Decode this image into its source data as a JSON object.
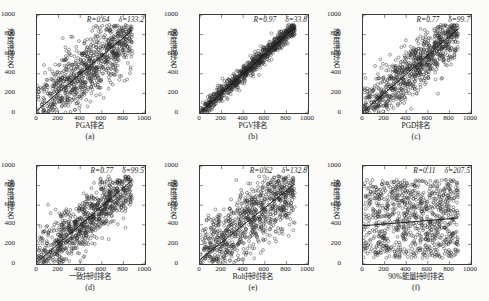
{
  "figure": {
    "ylabel": "速度谱排名",
    "axis_ticks": [
      "0",
      "200",
      "400",
      "600",
      "800",
      "1000"
    ],
    "axis_min": 0,
    "axis_max": 1000
  },
  "chart_data": [
    {
      "type": "scatter",
      "panel": "(a)",
      "xlabel": "PGA排名",
      "ylabel": "速度谱排名",
      "R_label": "R=0.64",
      "delta_label": "δ=133.2",
      "R": 0.64,
      "delta": 133.2,
      "xlim": [
        0,
        1000
      ],
      "ylim": [
        0,
        1000
      ],
      "xticks": [
        0,
        200,
        400,
        600,
        800,
        1000
      ],
      "yticks": [
        0,
        200,
        400,
        600,
        800,
        1000
      ],
      "grid": false,
      "n_points": 860,
      "spread": 175,
      "trend": {
        "slope": 0.93,
        "intercept": 25
      },
      "seed": 11
    },
    {
      "type": "scatter",
      "panel": "(b)",
      "xlabel": "PGV排名",
      "ylabel": "速度谱排名",
      "R_label": "R=0.97",
      "delta_label": "δ=33.8",
      "R": 0.97,
      "delta": 33.8,
      "xlim": [
        0,
        1000
      ],
      "ylim": [
        0,
        1000
      ],
      "xticks": [
        0,
        200,
        400,
        600,
        800,
        1000
      ],
      "yticks": [
        0,
        200,
        400,
        600,
        800,
        1000
      ],
      "grid": false,
      "n_points": 860,
      "spread": 45,
      "trend": {
        "slope": 0.99,
        "intercept": 5
      },
      "seed": 23
    },
    {
      "type": "scatter",
      "panel": "(c)",
      "xlabel": "PGD排名",
      "ylabel": "速度谱排名",
      "R_label": "R=0.77",
      "delta_label": "δ=99.7",
      "R": 0.77,
      "delta": 99.7,
      "xlim": [
        0,
        1000
      ],
      "ylim": [
        0,
        1000
      ],
      "xticks": [
        0,
        200,
        400,
        600,
        800,
        1000
      ],
      "yticks": [
        0,
        200,
        400,
        600,
        800,
        1000
      ],
      "grid": false,
      "n_points": 860,
      "spread": 135,
      "trend": {
        "slope": 0.96,
        "intercept": 12
      },
      "seed": 37
    },
    {
      "type": "scatter",
      "panel": "(d)",
      "xlabel": "一致持时排名",
      "ylabel": "速度谱排名",
      "R_label": "R=0.77",
      "delta_label": "δ=99.5",
      "R": 0.77,
      "delta": 99.5,
      "xlim": [
        0,
        1000
      ],
      "ylim": [
        0,
        1000
      ],
      "xticks": [
        0,
        200,
        400,
        600,
        800,
        1000
      ],
      "yticks": [
        0,
        200,
        400,
        600,
        800,
        1000
      ],
      "grid": false,
      "n_points": 860,
      "spread": 135,
      "trend": {
        "slope": 0.95,
        "intercept": 18
      },
      "seed": 53
    },
    {
      "type": "scatter",
      "panel": "(e)",
      "xlabel": "Bolt持时排名",
      "ylabel": "速度谱排名",
      "R_label": "R=0.62",
      "delta_label": "δ=132.8",
      "R": 0.62,
      "delta": 132.8,
      "xlim": [
        0,
        1000
      ],
      "ylim": [
        0,
        1000
      ],
      "xticks": [
        0,
        200,
        400,
        600,
        800,
        1000
      ],
      "yticks": [
        0,
        200,
        400,
        600,
        800,
        1000
      ],
      "grid": false,
      "n_points": 860,
      "spread": 185,
      "trend": {
        "slope": 0.88,
        "intercept": 45
      },
      "seed": 71
    },
    {
      "type": "scatter",
      "panel": "(f)",
      "xlabel": "90%能量持时排名",
      "ylabel": "速度谱排名",
      "R_label": "R=0.11",
      "delta_label": "δ=207.5",
      "R": 0.11,
      "delta": 207.5,
      "xlim": [
        0,
        1000
      ],
      "ylim": [
        0,
        1000
      ],
      "xticks": [
        0,
        200,
        400,
        600,
        800,
        1000
      ],
      "yticks": [
        0,
        200,
        400,
        600,
        800,
        1000
      ],
      "grid": false,
      "n_points": 900,
      "spread": 300,
      "trend": {
        "slope": 0.09,
        "intercept": 390
      },
      "seed": 97
    }
  ]
}
